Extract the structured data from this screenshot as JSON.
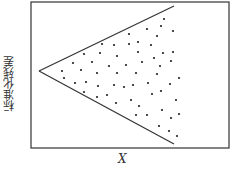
{
  "chart_data": {
    "type": "scatter",
    "title": "",
    "xlabel": "X",
    "ylabel": "标准化残差",
    "grid": false,
    "legend": null,
    "annotations": [
      "funnel-shaped envelope: two lines diverging from left apex (heteroscedasticity pattern)"
    ],
    "envelope_lines": [
      {
        "name": "upper",
        "x1": 39,
        "y1": 71,
        "x2": 174,
        "y2": 6
      },
      {
        "name": "lower",
        "x1": 39,
        "y1": 71,
        "x2": 174,
        "y2": 144
      }
    ],
    "points_px": [
      [
        164,
        19
      ],
      [
        161,
        26
      ],
      [
        147,
        29
      ],
      [
        129,
        34
      ],
      [
        173,
        31
      ],
      [
        157,
        36
      ],
      [
        102,
        44
      ],
      [
        114,
        45
      ],
      [
        129,
        44
      ],
      [
        138,
        42
      ],
      [
        151,
        45
      ],
      [
        84,
        54
      ],
      [
        100,
        53
      ],
      [
        117,
        56
      ],
      [
        138,
        52
      ],
      [
        163,
        53
      ],
      [
        173,
        52
      ],
      [
        154,
        58
      ],
      [
        73,
        63
      ],
      [
        92,
        62
      ],
      [
        109,
        66
      ],
      [
        126,
        65
      ],
      [
        142,
        62
      ],
      [
        171,
        61
      ],
      [
        160,
        66
      ],
      [
        62,
        71
      ],
      [
        81,
        70
      ],
      [
        97,
        73
      ],
      [
        117,
        73
      ],
      [
        136,
        73
      ],
      [
        157,
        74
      ],
      [
        64,
        78
      ],
      [
        179,
        78
      ],
      [
        75,
        83
      ],
      [
        86,
        82
      ],
      [
        98,
        86
      ],
      [
        114,
        85
      ],
      [
        124,
        87
      ],
      [
        133,
        85
      ],
      [
        148,
        83
      ],
      [
        170,
        84
      ],
      [
        84,
        92
      ],
      [
        152,
        94
      ],
      [
        161,
        91
      ],
      [
        97,
        97
      ],
      [
        107,
        95
      ],
      [
        116,
        103
      ],
      [
        131,
        100
      ],
      [
        176,
        100
      ],
      [
        139,
        106
      ],
      [
        162,
        110
      ],
      [
        136,
        115
      ],
      [
        147,
        115
      ],
      [
        179,
        114
      ],
      [
        171,
        118
      ],
      [
        159,
        126
      ],
      [
        169,
        131
      ],
      [
        177,
        136
      ]
    ],
    "frame": {
      "x": 31,
      "y": 2,
      "width": 198,
      "height": 146
    }
  },
  "labels": {
    "x": "X",
    "y": "标准化残差"
  },
  "colors": {
    "line": "#333333",
    "dot": "#222222",
    "frame": "#333333"
  }
}
